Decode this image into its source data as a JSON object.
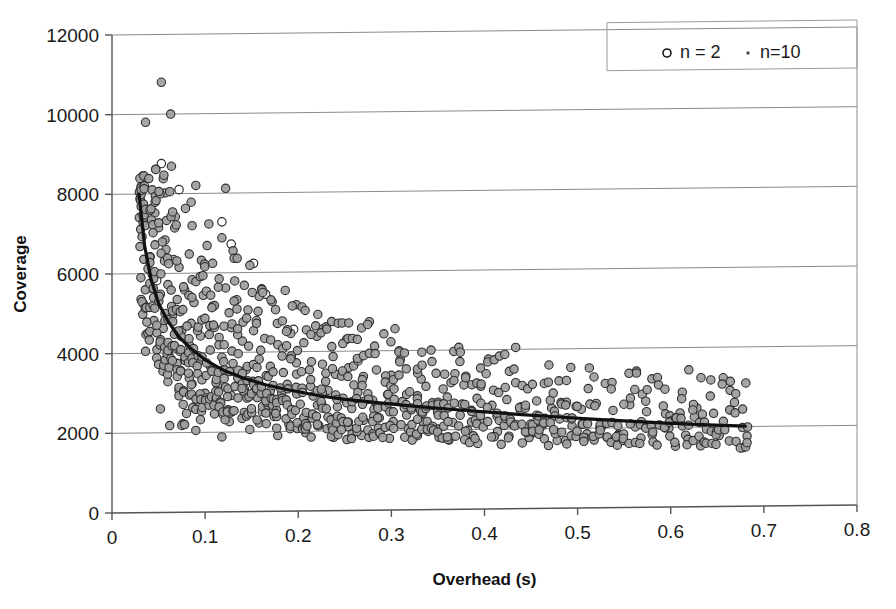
{
  "chart_data": {
    "type": "scatter",
    "title": "",
    "xlabel": "Overhead (s)",
    "ylabel": "Coverage",
    "xlim": [
      0,
      0.8
    ],
    "ylim": [
      0,
      12000
    ],
    "xticks": [
      "0",
      "0.1",
      "0.2",
      "0.3",
      "0.4",
      "0.5",
      "0.6",
      "0.7",
      "0.8"
    ],
    "xtick_values": [
      0,
      0.1,
      0.2,
      0.3,
      0.4,
      0.5,
      0.6,
      0.7,
      0.8
    ],
    "yticks": [
      "0",
      "2000",
      "4000",
      "6000",
      "8000",
      "10000",
      "12000"
    ],
    "ytick_values": [
      0,
      2000,
      4000,
      6000,
      8000,
      10000,
      12000
    ],
    "grid": "horizontal",
    "legend_position": "top-right",
    "legend": [
      {
        "label": "n = 2",
        "marker": "open-circle"
      },
      {
        "label": "n=10",
        "marker": "small-dot"
      }
    ],
    "series": [
      {
        "name": "n = 2",
        "marker": "open-circle",
        "points": [
          [
            0.053,
            8760
          ],
          [
            0.072,
            8100
          ],
          [
            0.118,
            7280
          ],
          [
            0.128,
            6720
          ],
          [
            0.152,
            6230
          ],
          [
            0.048,
            5820
          ],
          [
            0.165,
            5450
          ],
          [
            0.108,
            5160
          ],
          [
            0.063,
            4880
          ],
          [
            0.195,
            4560
          ]
        ]
      },
      {
        "name": "n=10",
        "marker": "gray-circle",
        "description": "Dense scatter of roughly 600 points decaying from ~8000 coverage near 0.03 s overhead to ~1800 coverage near 0.68 s overhead",
        "points": [
          [
            0.036,
            9800
          ],
          [
            0.053,
            10800
          ],
          [
            0.063,
            10000
          ],
          [
            0.033,
            8450
          ],
          [
            0.047,
            8620
          ],
          [
            0.055,
            8380
          ],
          [
            0.057,
            8020
          ],
          [
            0.062,
            8050
          ],
          [
            0.09,
            8200
          ],
          [
            0.122,
            8120
          ],
          [
            0.03,
            7880
          ],
          [
            0.046,
            7520
          ],
          [
            0.05,
            7150
          ],
          [
            0.068,
            7420
          ],
          [
            0.085,
            7780
          ],
          [
            0.104,
            7230
          ],
          [
            0.118,
            6880
          ],
          [
            0.03,
            6680
          ],
          [
            0.041,
            6420
          ],
          [
            0.058,
            6600
          ],
          [
            0.066,
            6350
          ],
          [
            0.072,
            6150
          ],
          [
            0.083,
            6480
          ],
          [
            0.096,
            6320
          ],
          [
            0.108,
            6240
          ],
          [
            0.13,
            6550
          ],
          [
            0.148,
            6180
          ],
          [
            0.031,
            5900
          ],
          [
            0.043,
            5620
          ],
          [
            0.052,
            5480
          ],
          [
            0.06,
            5720
          ],
          [
            0.07,
            5340
          ],
          [
            0.078,
            5580
          ],
          [
            0.088,
            5260
          ],
          [
            0.098,
            5440
          ],
          [
            0.11,
            5180
          ],
          [
            0.122,
            5620
          ],
          [
            0.134,
            5320
          ],
          [
            0.146,
            5060
          ],
          [
            0.158,
            5400
          ],
          [
            0.172,
            5260
          ],
          [
            0.186,
            5540
          ],
          [
            0.198,
            5180
          ],
          [
            0.033,
            4980
          ],
          [
            0.045,
            4820
          ],
          [
            0.055,
            4620
          ],
          [
            0.065,
            4940
          ],
          [
            0.075,
            4560
          ],
          [
            0.085,
            4740
          ],
          [
            0.095,
            4420
          ],
          [
            0.105,
            4680
          ],
          [
            0.115,
            4380
          ],
          [
            0.128,
            4620
          ],
          [
            0.14,
            4280
          ],
          [
            0.152,
            4540
          ],
          [
            0.164,
            4340
          ],
          [
            0.178,
            4180
          ],
          [
            0.192,
            4460
          ],
          [
            0.206,
            4220
          ],
          [
            0.22,
            4380
          ],
          [
            0.236,
            4120
          ],
          [
            0.252,
            4300
          ],
          [
            0.268,
            4580
          ],
          [
            0.282,
            4120
          ],
          [
            0.036,
            4050
          ],
          [
            0.048,
            3880
          ],
          [
            0.058,
            4180
          ],
          [
            0.07,
            3740
          ],
          [
            0.082,
            3960
          ],
          [
            0.094,
            3820
          ],
          [
            0.106,
            3640
          ],
          [
            0.118,
            3880
          ],
          [
            0.13,
            3720
          ],
          [
            0.144,
            3560
          ],
          [
            0.158,
            3820
          ],
          [
            0.17,
            3640
          ],
          [
            0.184,
            3480
          ],
          [
            0.198,
            3720
          ],
          [
            0.212,
            3540
          ],
          [
            0.226,
            3680
          ],
          [
            0.24,
            3420
          ],
          [
            0.254,
            3580
          ],
          [
            0.27,
            3360
          ],
          [
            0.284,
            3520
          ],
          [
            0.3,
            3380
          ],
          [
            0.316,
            3540
          ],
          [
            0.332,
            3280
          ],
          [
            0.348,
            3420
          ],
          [
            0.364,
            3180
          ],
          [
            0.38,
            3340
          ],
          [
            0.396,
            3080
          ],
          [
            0.06,
            3280
          ],
          [
            0.072,
            3060
          ],
          [
            0.086,
            3220
          ],
          [
            0.1,
            2980
          ],
          [
            0.114,
            3160
          ],
          [
            0.128,
            2920
          ],
          [
            0.142,
            3080
          ],
          [
            0.156,
            2860
          ],
          [
            0.17,
            3020
          ],
          [
            0.186,
            2800
          ],
          [
            0.2,
            2960
          ],
          [
            0.216,
            2880
          ],
          [
            0.232,
            3020
          ],
          [
            0.248,
            2820
          ],
          [
            0.264,
            2960
          ],
          [
            0.28,
            2760
          ],
          [
            0.296,
            2900
          ],
          [
            0.312,
            2720
          ],
          [
            0.328,
            2860
          ],
          [
            0.344,
            2680
          ],
          [
            0.36,
            2820
          ],
          [
            0.376,
            2640
          ],
          [
            0.392,
            2780
          ],
          [
            0.408,
            2600
          ],
          [
            0.424,
            2740
          ],
          [
            0.44,
            2560
          ],
          [
            0.456,
            2700
          ],
          [
            0.472,
            2520
          ],
          [
            0.488,
            2660
          ],
          [
            0.504,
            2480
          ],
          [
            0.52,
            2620
          ],
          [
            0.538,
            2440
          ],
          [
            0.556,
            2580
          ],
          [
            0.574,
            2400
          ],
          [
            0.592,
            2540
          ],
          [
            0.61,
            2360
          ],
          [
            0.628,
            2480
          ],
          [
            0.646,
            2340
          ],
          [
            0.664,
            2420
          ],
          [
            0.682,
            1760
          ],
          [
            0.08,
            2480
          ],
          [
            0.095,
            2320
          ],
          [
            0.11,
            2460
          ],
          [
            0.126,
            2260
          ],
          [
            0.142,
            2400
          ],
          [
            0.158,
            2220
          ],
          [
            0.174,
            2380
          ],
          [
            0.19,
            2180
          ],
          [
            0.206,
            2340
          ],
          [
            0.222,
            2140
          ],
          [
            0.238,
            2300
          ],
          [
            0.254,
            2100
          ],
          [
            0.27,
            2260
          ],
          [
            0.286,
            2060
          ],
          [
            0.302,
            2220
          ],
          [
            0.318,
            2040
          ],
          [
            0.334,
            2200
          ],
          [
            0.35,
            2020
          ],
          [
            0.366,
            2180
          ],
          [
            0.382,
            1980
          ],
          [
            0.398,
            2160
          ],
          [
            0.414,
            1940
          ],
          [
            0.43,
            2120
          ],
          [
            0.446,
            1900
          ],
          [
            0.462,
            2080
          ],
          [
            0.478,
            1880
          ],
          [
            0.494,
            2060
          ],
          [
            0.51,
            1860
          ],
          [
            0.526,
            2040
          ],
          [
            0.544,
            1840
          ],
          [
            0.562,
            2020
          ],
          [
            0.58,
            1820
          ],
          [
            0.598,
            1980
          ],
          [
            0.616,
            1800
          ],
          [
            0.634,
            2320
          ],
          [
            0.652,
            1780
          ],
          [
            0.062,
            2180
          ],
          [
            0.076,
            2220
          ],
          [
            0.09,
            2050
          ],
          [
            0.118,
            1880
          ],
          [
            0.148,
            2060
          ],
          [
            0.178,
            1900
          ],
          [
            0.208,
            1960
          ],
          [
            0.238,
            1840
          ],
          [
            0.268,
            1880
          ],
          [
            0.276,
            1830
          ],
          [
            0.298,
            1800
          ],
          [
            0.328,
            1860
          ],
          [
            0.358,
            1790
          ],
          [
            0.388,
            1840
          ],
          [
            0.418,
            1620
          ],
          [
            0.448,
            1780
          ],
          [
            0.478,
            1700
          ],
          [
            0.508,
            1760
          ],
          [
            0.538,
            1680
          ],
          [
            0.568,
            1740
          ],
          [
            0.05,
            3720
          ],
          [
            0.052,
            2600
          ],
          [
            0.075,
            2180
          ],
          [
            0.078,
            2200
          ]
        ]
      }
    ],
    "trendline": {
      "name": "power-fit",
      "description": "Smooth decaying power-law fit through the cloud",
      "points": [
        [
          0.029,
          8000
        ],
        [
          0.035,
          6700
        ],
        [
          0.042,
          5850
        ],
        [
          0.05,
          5250
        ],
        [
          0.06,
          4800
        ],
        [
          0.072,
          4400
        ],
        [
          0.085,
          4100
        ],
        [
          0.1,
          3820
        ],
        [
          0.12,
          3550
        ],
        [
          0.14,
          3360
        ],
        [
          0.165,
          3180
        ],
        [
          0.19,
          3040
        ],
        [
          0.22,
          2900
        ],
        [
          0.25,
          2790
        ],
        [
          0.285,
          2700
        ],
        [
          0.32,
          2610
        ],
        [
          0.36,
          2520
        ],
        [
          0.4,
          2440
        ],
        [
          0.44,
          2360
        ],
        [
          0.48,
          2290
        ],
        [
          0.52,
          2220
        ],
        [
          0.56,
          2160
        ],
        [
          0.6,
          2100
        ],
        [
          0.64,
          2050
        ],
        [
          0.68,
          2010
        ]
      ]
    }
  }
}
